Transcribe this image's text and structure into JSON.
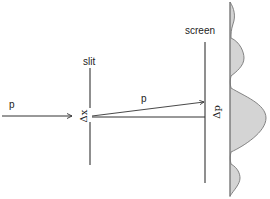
{
  "diagram": {
    "labels": {
      "incoming_momentum": "p",
      "slit": "slit",
      "screen": "screen",
      "deflected_momentum": "p",
      "slit_width": "Δx",
      "momentum_spread": "Δp"
    },
    "colors": {
      "line": "#333333",
      "pattern_fill": "#d4d4d4",
      "pattern_stroke": "#777777"
    }
  }
}
